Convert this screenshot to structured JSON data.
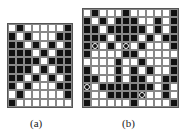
{
  "figures": [
    {
      "id": "a",
      "caption": "(a)",
      "rows": [
        "WBWWWWWB",
        "BWBWWWBB",
        "BBWBWBWB",
        "BBBWBWBB",
        "BBBBWBBB",
        "BBBWBWBB",
        "BBWBWBWB",
        "BWBWWWBB",
        "WBWWWWWB",
        "BWWWWWWW"
      ]
    },
    {
      "id": "b",
      "caption": "(b)",
      "rows": [
        "WBWWWBWWWWWB",
        "BWBWBBBWWBWB",
        "BBWBBBBBWBWB",
        "BBBWBBBWBWBB",
        "BOWBWOWBWWWB",
        "BWWWWBBWWWWW",
        "WWWWBWWBWWWB",
        "BWWWBWBWBWWB",
        "BBWWBWBBWWBB",
        "OWBBBBBBBWBW",
        "BWWBBBBOWWBW",
        "BWWWWWBWWWWB"
      ],
      "legend": {
        "B": "black cell",
        "W": "white cell",
        "O": "black cell with circle mark"
      }
    }
  ]
}
